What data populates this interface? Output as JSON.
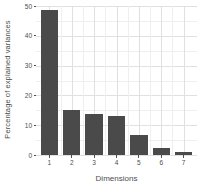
{
  "chart_data": {
    "type": "bar",
    "title": "",
    "subtitle": "",
    "xlabel": "Dimensions",
    "ylabel": "Percentage of explained variances",
    "categories": [
      "1",
      "2",
      "3",
      "4",
      "5",
      "6",
      "7"
    ],
    "values": [
      48.8,
      15.2,
      13.8,
      13.1,
      6.8,
      2.5,
      1.1
    ],
    "series": [
      {
        "name": "Percentage of explained variances",
        "values": [
          48.8,
          15.2,
          13.8,
          13.1,
          6.8,
          2.5,
          1.1
        ]
      }
    ],
    "ylim": [
      0,
      50
    ],
    "xlim": [
      0.4,
      7.6
    ],
    "y_ticks": [
      0,
      10,
      20,
      30,
      40,
      50
    ],
    "y_tick_labels": [
      "0",
      "10",
      "20",
      "30",
      "40",
      "50"
    ],
    "y_minor_ticks": [
      5,
      15,
      25,
      35,
      45
    ],
    "x_tick_labels": [
      "1",
      "2",
      "3",
      "4",
      "5",
      "6",
      "7"
    ],
    "grid": true,
    "grid_major_color": "#e0e0e0",
    "grid_minor_color": "#efefef",
    "legend": null,
    "legend_position": "none",
    "bar_color": "#4a4a4a",
    "background_color": "#ffffff",
    "axis_text_color": "#4d4d4d",
    "annotations": []
  },
  "axes": {
    "y_title": "Percentage of explained variances",
    "x_title": "Dimensions",
    "y_labels": [
      "50",
      "40",
      "30",
      "20",
      "10",
      "0"
    ],
    "x_labels": [
      "1",
      "2",
      "3",
      "4",
      "5",
      "6",
      "7"
    ]
  }
}
